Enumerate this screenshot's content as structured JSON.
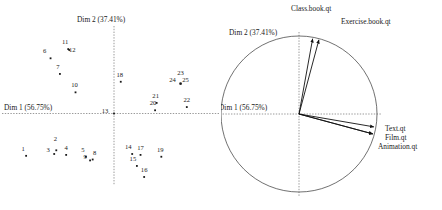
{
  "figure": {
    "kind": "pca-biplot-pair",
    "background_color": "#ffffff",
    "ink_color": "#1a1a1a"
  },
  "chart_data": [
    {
      "type": "scatter",
      "title": "",
      "panel": "individuals-factor-map",
      "xlabel": "Dim 1 (56.75%)",
      "ylabel": "Dim 2 (37.41%)",
      "xlim": [
        -1.0,
        1.0
      ],
      "ylim": [
        -1.0,
        1.0
      ],
      "grid": false,
      "axis_lines": "dashed-through-origin",
      "legend": "none",
      "point_labels": [
        "1",
        "2",
        "3",
        "4",
        "5",
        "6",
        "7",
        "8",
        "9",
        "10",
        "11",
        "12",
        "13",
        "14",
        "15",
        "16",
        "17",
        "18",
        "19",
        "20",
        "21",
        "22",
        "23",
        "24",
        "25"
      ],
      "points": [
        {
          "label": "1",
          "x": -0.845,
          "y": -0.46
        },
        {
          "label": "2",
          "x": -0.555,
          "y": -0.4
        },
        {
          "label": "3",
          "x": -0.575,
          "y": -0.44
        },
        {
          "label": "4",
          "x": -0.46,
          "y": -0.45
        },
        {
          "label": "5",
          "x": -0.27,
          "y": -0.47
        },
        {
          "label": "6",
          "x": -0.61,
          "y": 0.6
        },
        {
          "label": "7",
          "x": -0.52,
          "y": 0.43
        },
        {
          "label": "8",
          "x": -0.205,
          "y": -0.5
        },
        {
          "label": "9",
          "x": -0.23,
          "y": -0.51
        },
        {
          "label": "10",
          "x": -0.37,
          "y": 0.23
        },
        {
          "label": "11",
          "x": -0.44,
          "y": 0.7
        },
        {
          "label": "12",
          "x": -0.43,
          "y": 0.69
        },
        {
          "label": "13",
          "x": 0.0,
          "y": 0.0
        },
        {
          "label": "14",
          "x": 0.175,
          "y": -0.44
        },
        {
          "label": "15",
          "x": 0.22,
          "y": -0.57
        },
        {
          "label": "16",
          "x": 0.29,
          "y": -0.69
        },
        {
          "label": "17",
          "x": 0.255,
          "y": -0.45
        },
        {
          "label": "18",
          "x": 0.065,
          "y": 0.345
        },
        {
          "label": "19",
          "x": 0.455,
          "y": -0.47
        },
        {
          "label": "20",
          "x": 0.395,
          "y": 0.035
        },
        {
          "label": "21",
          "x": 0.41,
          "y": 0.115
        },
        {
          "label": "22",
          "x": 0.7,
          "y": 0.07
        },
        {
          "label": "23",
          "x": 0.64,
          "y": 0.325
        },
        {
          "label": "24",
          "x": 0.64,
          "y": 0.325
        },
        {
          "label": "25",
          "x": 0.64,
          "y": 0.325
        }
      ]
    },
    {
      "type": "scatter",
      "panel": "variables-correlation-circle",
      "title": "",
      "xlabel": "Dim 1 (56.75%)",
      "ylabel": "Dim 2 (37.41%)",
      "xlim": [
        -1.0,
        1.0
      ],
      "ylim": [
        -1.0,
        1.0
      ],
      "grid": false,
      "axis_lines": "dashed-through-origin",
      "unit_circle": true,
      "legend": "none",
      "variables": [
        {
          "name": "Class.book.qt",
          "x": 0.175,
          "y": 0.965
        },
        {
          "name": "Exercise.book.qt",
          "x": 0.255,
          "y": 0.95
        },
        {
          "name": "Text.qt",
          "x": 0.96,
          "y": -0.165
        },
        {
          "name": "Film.qt",
          "x": 0.945,
          "y": -0.255
        },
        {
          "name": "Animation.qt",
          "x": 0.945,
          "y": -0.255
        }
      ]
    }
  ],
  "left_panel": {
    "name": "individuals-plot",
    "axis_x_label": "Dim 1 (56.75%)",
    "axis_y_label": "Dim 2 (37.41%)"
  },
  "right_panel": {
    "name": "variables-plot",
    "axis_x_label": "Dim 1 (56.75%)",
    "axis_y_label": "Dim 2 (37.41%)",
    "labels": {
      "class_book": "Class.book.qt",
      "exercise_book": "Exercise.book.qt",
      "text": "Text.qt",
      "film": "Film.qt",
      "animation": "Animation.qt"
    }
  }
}
